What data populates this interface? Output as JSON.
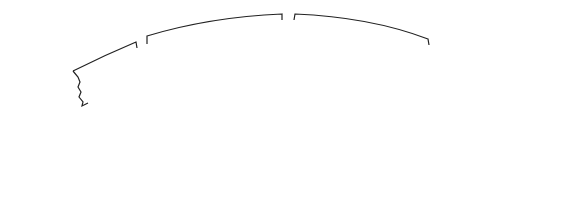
{
  "diagram": {
    "type": "double-squirrel-cage rotor cross-section",
    "colors": {
      "ink": "#222222",
      "background": "#ffffff"
    },
    "slots": [
      {
        "id": "left",
        "outer_bar": "circular, high-resistance",
        "inner_bar": "elongated, low-resistance"
      },
      {
        "id": "center",
        "outer_bar": "circular, high-resistance",
        "inner_bar": "elongated, low-resistance"
      },
      {
        "id": "right",
        "outer_bar": "circular, high-resistance",
        "inner_bar": "elongated, low-resistance"
      }
    ]
  },
  "labels": {
    "inner": {
      "line1": "INNER SQUIRREL-",
      "line2": "CAGE WINDING HAS",
      "line3": "LOW-RESISTANCE",
      "line4": "BARS"
    },
    "outer": {
      "line1": "OUTER SQUIRREL-CAGE",
      "line2": "WINDING HAS HIGH-",
      "line3": "RESISTANCE BARS"
    }
  }
}
